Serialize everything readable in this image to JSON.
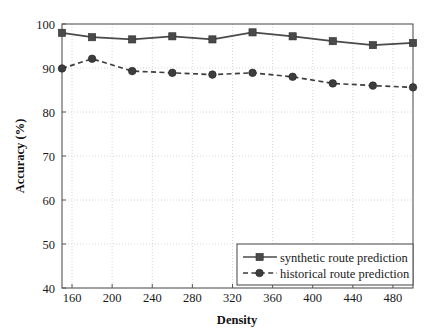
{
  "chart_data": {
    "type": "line",
    "title": "",
    "subtitle": "",
    "xlabel": "Density",
    "ylabel": "Accuracy (%)",
    "xlim": [
      150,
      500
    ],
    "ylim": [
      40,
      100
    ],
    "xticks": [
      160,
      200,
      240,
      280,
      320,
      360,
      400,
      440,
      480
    ],
    "yticks": [
      40,
      50,
      60,
      70,
      80,
      90,
      100
    ],
    "xtick_labels": [
      "160",
      "200",
      "240",
      "280",
      "320",
      "360",
      "400",
      "440",
      "480"
    ],
    "ytick_labels": [
      "40",
      "50",
      "60",
      "70",
      "80",
      "90",
      "100"
    ],
    "grid": true,
    "grid_style": "dotted",
    "legend_position": "lower right",
    "x": [
      150,
      180,
      220,
      260,
      300,
      340,
      380,
      420,
      460,
      500
    ],
    "series": [
      {
        "name": "synthetic route prediction",
        "values": [
          98.0,
          97.0,
          96.5,
          97.2,
          96.5,
          98.1,
          97.2,
          96.1,
          95.2,
          95.7
        ],
        "line_style": "solid",
        "marker": "square",
        "color": "#4a4a4a"
      },
      {
        "name": "historical route prediction",
        "values": [
          89.9,
          92.1,
          89.3,
          88.9,
          88.5,
          88.9,
          88.0,
          86.5,
          86.0,
          85.6
        ],
        "line_style": "dashed",
        "marker": "circle",
        "color": "#3d3d3d"
      }
    ],
    "colors": {
      "axis": "#555555",
      "grid": "#cccccc",
      "text": "#1a1a1a",
      "background": "#ffffff"
    }
  },
  "legend": {
    "items": [
      {
        "label": "synthetic route prediction"
      },
      {
        "label": "historical route prediction"
      }
    ]
  },
  "axes": {
    "x_title": "Density",
    "y_title": "Accuracy (%)"
  }
}
